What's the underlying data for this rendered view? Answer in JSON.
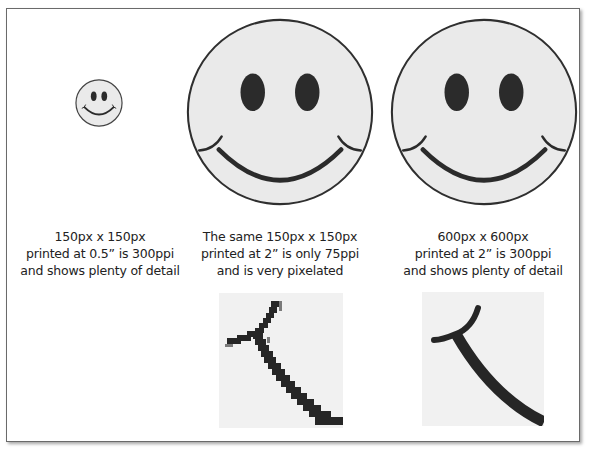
{
  "figure": {
    "colors": {
      "face_fill": "#eaeaea",
      "outline": "#333333",
      "feature": "#2b2b2b",
      "frame_border": "#6a6a6a",
      "crop_bg": "#f1f1f1"
    },
    "panels": [
      {
        "id": "small",
        "caption_lines": [
          "150px x 150px",
          "printed at 0.5” is 300ppi",
          "and shows plenty of detail"
        ]
      },
      {
        "id": "pixelated",
        "caption_lines": [
          "The same 150px x 150px",
          "printed at 2” is only 75ppi",
          "and is very pixelated"
        ],
        "detail_crop": "pixelated smile corner"
      },
      {
        "id": "sharp",
        "caption_lines": [
          "600px x 600px",
          "printed at 2” is 300ppi",
          "and shows plenty of detail"
        ],
        "detail_crop": "sharp smile corner"
      }
    ]
  }
}
